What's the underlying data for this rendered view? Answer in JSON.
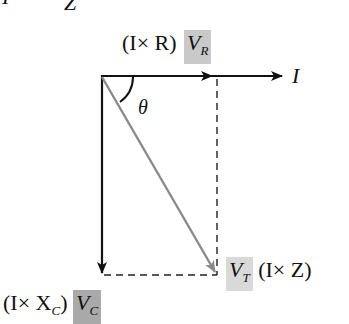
{
  "diagram": {
    "type": "phasor-diagram",
    "top_fragment": {
      "left_glyph": "I",
      "right_glyph": "Z"
    },
    "labels": {
      "vr": {
        "prefix": "(I× R)",
        "symbol": "V",
        "subscript": "R",
        "box_color": "#c9c9c9"
      },
      "current": {
        "symbol": "I"
      },
      "theta": {
        "symbol": "θ"
      },
      "vt": {
        "symbol": "V",
        "subscript": "T",
        "suffix": "(I× Z)",
        "box_color": "#d9d9d9"
      },
      "vc": {
        "prefix": "(I× X",
        "prefix_subscript": "C",
        "prefix_close": ")",
        "symbol": "V",
        "subscript": "C",
        "box_color": "#a9a9a9"
      }
    },
    "colors": {
      "axis": "#111111",
      "resultant": "#8a8a8a",
      "dashed": "#222222"
    }
  }
}
